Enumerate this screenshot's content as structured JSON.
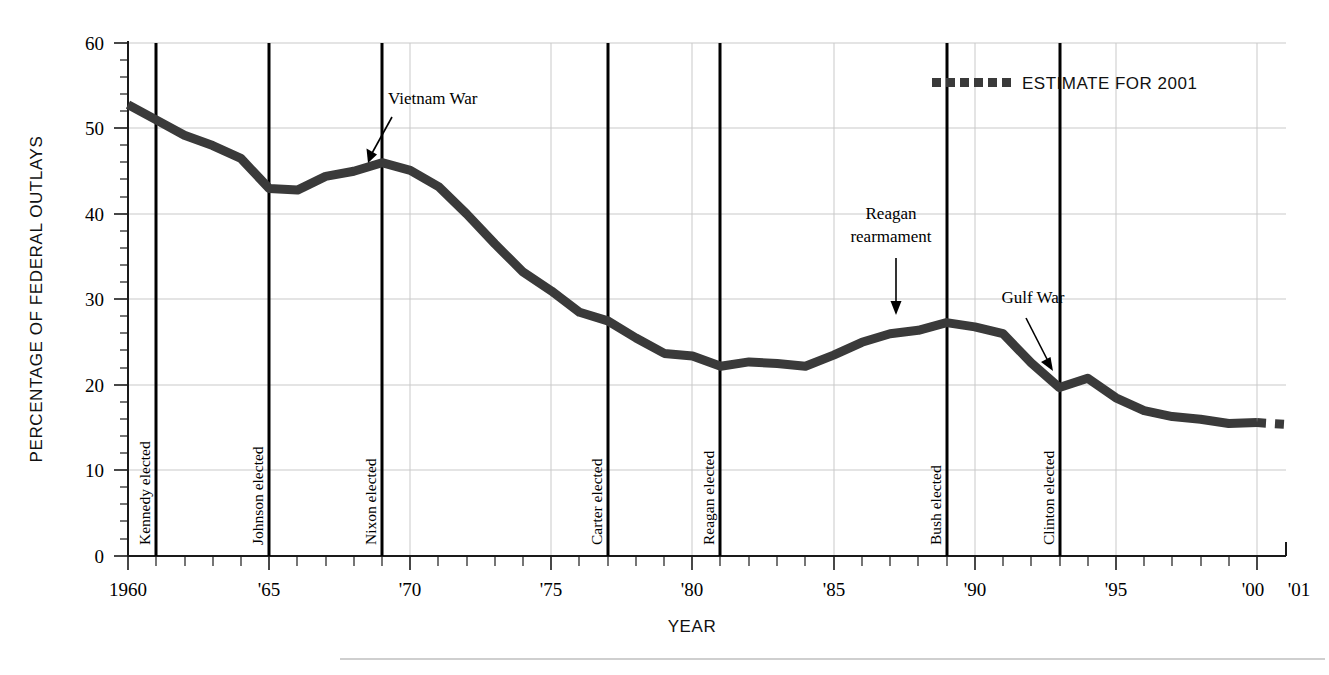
{
  "chart_data": {
    "type": "line",
    "title": "",
    "xlabel": "YEAR",
    "ylabel": "PERCENTAGE OF FEDERAL OUTLAYS",
    "xlim": [
      1960,
      2001
    ],
    "ylim": [
      0,
      60
    ],
    "grid": true,
    "legend_position": "top-right",
    "y_ticks": [
      0,
      10,
      20,
      30,
      40,
      50,
      60
    ],
    "y_tick_labels": [
      "0",
      "10",
      "20",
      "30",
      "40",
      "50",
      "60"
    ],
    "y_minor_tick_step": 2,
    "x_ticks": [
      1960,
      1965,
      1970,
      1975,
      1980,
      1985,
      1990,
      1995,
      2000,
      2001
    ],
    "x_tick_labels": [
      "1960",
      "'65",
      "'70",
      "'75",
      "'80",
      "'85",
      "'90",
      "'95",
      "'00",
      "'01"
    ],
    "x_minor_tick_step": 1,
    "series": [
      {
        "name": "Defense spending as percentage of federal outlays",
        "style": "solid",
        "x": [
          1960,
          1961,
          1962,
          1963,
          1964,
          1965,
          1966,
          1967,
          1968,
          1969,
          1970,
          1971,
          1972,
          1973,
          1974,
          1975,
          1976,
          1977,
          1978,
          1979,
          1980,
          1981,
          1982,
          1983,
          1984,
          1985,
          1986,
          1987,
          1988,
          1989,
          1990,
          1991,
          1992,
          1993,
          1994,
          1995,
          1996,
          1997,
          1998,
          1999,
          2000
        ],
        "values": [
          52.8,
          51.0,
          49.2,
          48.0,
          46.5,
          43.0,
          42.8,
          44.4,
          45.0,
          46.0,
          45.1,
          43.2,
          40.0,
          36.5,
          33.2,
          31.0,
          28.5,
          27.5,
          25.5,
          23.7,
          23.4,
          22.2,
          22.7,
          22.5,
          22.2,
          23.5,
          25.0,
          26.0,
          26.4,
          27.3,
          26.8,
          26.0,
          22.6,
          19.7,
          20.8,
          18.5,
          17.0,
          16.3,
          16.0,
          15.5,
          15.6
        ]
      },
      {
        "name": "Estimate for 2001",
        "style": "dotted",
        "x": [
          2000,
          2001
        ],
        "values": [
          15.6,
          15.4
        ]
      }
    ],
    "legend": [
      {
        "label": "ESTIMATE FOR 2001",
        "style": "dotted",
        "color": "#3a3a3a"
      }
    ],
    "event_lines": [
      {
        "year": 1961,
        "label": "Kennedy elected"
      },
      {
        "year": 1965,
        "label": "Johnson elected"
      },
      {
        "year": 1969,
        "label": "Nixon elected"
      },
      {
        "year": 1977,
        "label": "Carter elected"
      },
      {
        "year": 1981,
        "label": "Reagan elected"
      },
      {
        "year": 1989,
        "label": "Bush elected"
      },
      {
        "year": 1993,
        "label": "Clinton elected"
      }
    ],
    "annotations": [
      {
        "label": "Vietnam War",
        "target_year": 1968,
        "target_value": 45.6
      },
      {
        "label": "Reagan rearmament",
        "label_line_1": "Reagan",
        "label_line_2": "rearmament",
        "target_year": 1987,
        "target_value": 27.3
      },
      {
        "label": "Gulf War",
        "target_year": 1992,
        "target_value": 20.8
      }
    ]
  },
  "axes": {
    "y_title": "PERCENTAGE OF FEDERAL OUTLAYS",
    "x_title": "YEAR"
  },
  "legend": {
    "estimate_label": "ESTIMATE FOR 2001"
  },
  "annotations": {
    "vietnam": "Vietnam War",
    "reagan_line1": "Reagan",
    "reagan_line2": "rearmament",
    "gulf": "Gulf War"
  },
  "events": {
    "kennedy": "Kennedy elected",
    "johnson": "Johnson elected",
    "nixon": "Nixon elected",
    "carter": "Carter elected",
    "reagan": "Reagan elected",
    "bush": "Bush elected",
    "clinton": "Clinton elected"
  },
  "yticks": {
    "t0": "0",
    "t10": "10",
    "t20": "20",
    "t30": "30",
    "t40": "40",
    "t50": "50",
    "t60": "60"
  },
  "xticks": {
    "x1960": "1960",
    "x1965": "'65",
    "x1970": "'70",
    "x1975": "'75",
    "x1980": "'80",
    "x1985": "'85",
    "x1990": "'90",
    "x1995": "'95",
    "x2000": "'00",
    "x2001": "'01"
  },
  "colors": {
    "series": "#3a3a3a",
    "grid": "#c9c9c9",
    "axis": "#1a1a1a",
    "event_line": "#000000",
    "background": "#ffffff"
  }
}
